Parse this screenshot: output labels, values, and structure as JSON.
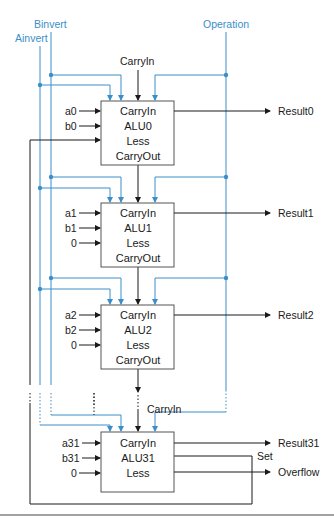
{
  "diagram": {
    "control_signals": {
      "binvert": "Binvert",
      "ainvert": "Ainvert",
      "operation": "Operation",
      "carryin_top": "CarryIn",
      "carryin_last": "CarryIn"
    },
    "alus": [
      {
        "name": "ALU0",
        "a": "a0",
        "b": "b0",
        "less": "",
        "ports": [
          "CarryIn",
          "ALU0",
          "Less",
          "CarryOut"
        ],
        "result": "Result0"
      },
      {
        "name": "ALU1",
        "a": "a1",
        "b": "b1",
        "less": "0",
        "ports": [
          "CarryIn",
          "ALU1",
          "Less",
          "CarryOut"
        ],
        "result": "Result1"
      },
      {
        "name": "ALU2",
        "a": "a2",
        "b": "b2",
        "less": "0",
        "ports": [
          "CarryIn",
          "ALU2",
          "Less",
          "CarryOut"
        ],
        "result": "Result2"
      },
      {
        "name": "ALU31",
        "a": "a31",
        "b": "b31",
        "less": "0",
        "ports": [
          "CarryIn",
          "ALU31",
          "Less"
        ],
        "result": "Result31"
      }
    ],
    "outputs": {
      "set": "Set",
      "overflow": "Overflow"
    },
    "colors": {
      "control_line": "#3a8fc8",
      "data_line": "#1a1a1a",
      "box_border": "#555555"
    }
  }
}
